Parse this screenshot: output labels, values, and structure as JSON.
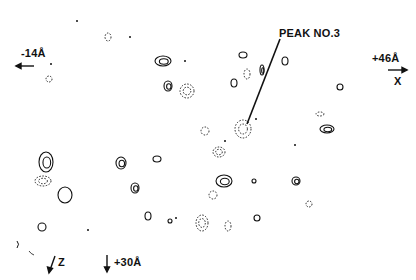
{
  "figure": {
    "type": "contour-map",
    "ink_color": "#111111",
    "background": "#ffffff"
  },
  "labels": {
    "peak": "PEAK NO.3",
    "left_axis": "-14Å",
    "right_axis": "+46Å",
    "x_axis": "X",
    "z_axis": "Z",
    "bottom_axis": "+30Å"
  },
  "peaks": {
    "solid": [
      {
        "cx": 163,
        "cy": 61,
        "rx": 8,
        "ry": 5,
        "levels": 2
      },
      {
        "cx": 168,
        "cy": 86,
        "rx": 4,
        "ry": 5,
        "levels": 2
      },
      {
        "cx": 243,
        "cy": 55,
        "rx": 4,
        "ry": 3,
        "levels": 1
      },
      {
        "cx": 234,
        "cy": 83,
        "rx": 3,
        "ry": 4,
        "levels": 1
      },
      {
        "cx": 262,
        "cy": 70,
        "rx": 2,
        "ry": 5,
        "levels": 2
      },
      {
        "cx": 285,
        "cy": 61,
        "rx": 3,
        "ry": 4,
        "levels": 1
      },
      {
        "cx": 340,
        "cy": 87,
        "rx": 3,
        "ry": 3,
        "levels": 1
      },
      {
        "cx": 327,
        "cy": 129,
        "rx": 7,
        "ry": 4,
        "levels": 2
      },
      {
        "cx": 46,
        "cy": 162,
        "rx": 7,
        "ry": 10,
        "levels": 2
      },
      {
        "cx": 121,
        "cy": 163,
        "rx": 5,
        "ry": 6,
        "levels": 2
      },
      {
        "cx": 157,
        "cy": 159,
        "rx": 4,
        "ry": 3,
        "levels": 1
      },
      {
        "cx": 65,
        "cy": 195,
        "rx": 7,
        "ry": 8,
        "levels": 1
      },
      {
        "cx": 135,
        "cy": 188,
        "rx": 4,
        "ry": 5,
        "levels": 2
      },
      {
        "cx": 224,
        "cy": 181,
        "rx": 8,
        "ry": 6,
        "levels": 2
      },
      {
        "cx": 254,
        "cy": 181,
        "rx": 2,
        "ry": 2,
        "levels": 1
      },
      {
        "cx": 296,
        "cy": 181,
        "rx": 4,
        "ry": 4,
        "levels": 2
      },
      {
        "cx": 148,
        "cy": 216,
        "rx": 3,
        "ry": 4,
        "levels": 1
      },
      {
        "cx": 170,
        "cy": 221,
        "rx": 2,
        "ry": 2,
        "levels": 1
      },
      {
        "cx": 42,
        "cy": 227,
        "rx": 4,
        "ry": 4,
        "levels": 1
      },
      {
        "cx": 257,
        "cy": 218,
        "rx": 3,
        "ry": 3,
        "levels": 1
      }
    ],
    "dashed": [
      {
        "cx": 108,
        "cy": 37,
        "rx": 3,
        "ry": 4
      },
      {
        "cx": 49,
        "cy": 79,
        "rx": 3,
        "ry": 3
      },
      {
        "cx": 187,
        "cy": 91,
        "rx": 7,
        "ry": 7
      },
      {
        "cx": 247,
        "cy": 74,
        "rx": 3,
        "ry": 5
      },
      {
        "cx": 243,
        "cy": 129,
        "rx": 8,
        "ry": 9
      },
      {
        "cx": 219,
        "cy": 152,
        "rx": 6,
        "ry": 5
      },
      {
        "cx": 213,
        "cy": 195,
        "rx": 4,
        "ry": 4
      },
      {
        "cx": 320,
        "cy": 114,
        "rx": 4,
        "ry": 2
      },
      {
        "cx": 43,
        "cy": 181,
        "rx": 8,
        "ry": 5
      },
      {
        "cx": 202,
        "cy": 223,
        "rx": 6,
        "ry": 8
      },
      {
        "cx": 228,
        "cy": 226,
        "rx": 3,
        "ry": 5
      },
      {
        "cx": 309,
        "cy": 204,
        "rx": 3,
        "ry": 3
      },
      {
        "cx": 205,
        "cy": 131,
        "rx": 4,
        "ry": 4
      }
    ],
    "dots": [
      {
        "cx": 185,
        "cy": 61
      },
      {
        "cx": 256,
        "cy": 119
      },
      {
        "cx": 225,
        "cy": 141
      },
      {
        "cx": 295,
        "cy": 145
      },
      {
        "cx": 130,
        "cy": 37
      },
      {
        "cx": 77,
        "cy": 21
      },
      {
        "cx": 51,
        "cy": 64
      },
      {
        "cx": 88,
        "cy": 230
      },
      {
        "cx": 176,
        "cy": 218
      }
    ]
  }
}
